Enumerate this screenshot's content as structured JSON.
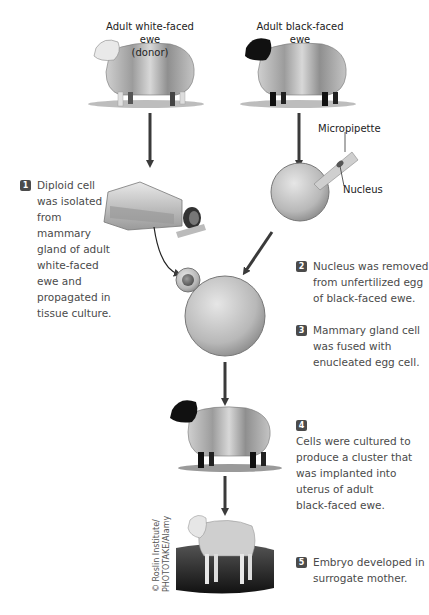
{
  "diagram": {
    "title_donor": "Adult white-faced ewe",
    "title_donor_sub": "(donor)",
    "title_recipient": "Adult black-faced ewe",
    "micropipette_label": "Micropipette",
    "nucleus_label": "Nucleus",
    "credit_line1": "© Roslin Institute/",
    "credit_line2": "PHOTOTAKE/Alamy",
    "colors": {
      "arrow": "#3a3a3a",
      "badge": "#4b4b4b",
      "cell": "#c8c8c8",
      "text": "#4a4a4a"
    },
    "steps": [
      {
        "num": "1",
        "lines": [
          "Diploid cell",
          "was isolated",
          "from",
          "mammary",
          "gland of adult",
          "white-faced",
          "ewe and",
          "propagated in",
          "tissue culture."
        ]
      },
      {
        "num": "2",
        "lines": [
          "Nucleus was removed",
          "from unfertilized egg",
          "of black-faced ewe."
        ]
      },
      {
        "num": "3",
        "lines": [
          "Mammary gland cell",
          "was fused with",
          "enucleated egg cell."
        ]
      },
      {
        "num": "4",
        "lines": [
          "Cells were cultured to",
          "produce a cluster that",
          "was implanted into",
          "uterus of adult",
          "black-faced ewe."
        ]
      },
      {
        "num": "5",
        "lines": [
          "Embryo developed in",
          "surrogate mother."
        ]
      }
    ]
  }
}
